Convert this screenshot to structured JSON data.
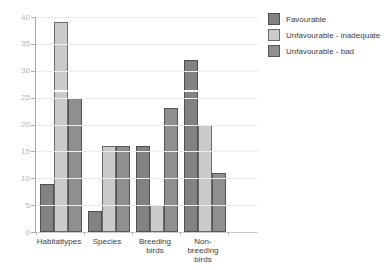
{
  "chart_data": {
    "type": "bar",
    "title": "",
    "xlabel": "",
    "ylabel": "",
    "ylim": [
      0,
      40
    ],
    "yticks": [
      0,
      5,
      10,
      15,
      20,
      25,
      30,
      35,
      40
    ],
    "grid": true,
    "legend_position": "top-right",
    "categories": [
      {
        "label": "Habitattypes",
        "lines": [
          "Habitattypes"
        ]
      },
      {
        "label": "Species",
        "lines": [
          "Species"
        ]
      },
      {
        "label": "Breeding birds",
        "lines": [
          "Breeding",
          "birds"
        ]
      },
      {
        "label": "Non-breeding birds",
        "lines": [
          "Non-breeding",
          "birds"
        ]
      }
    ],
    "series": [
      {
        "name": "Favourable",
        "color": "#828282",
        "border": "#4f4f4f",
        "values": [
          9,
          4,
          16,
          32
        ]
      },
      {
        "name": "Unfavourable - inadequate",
        "color": "#cbcbcb",
        "border": "#6a6a6a",
        "values": [
          39,
          16,
          5,
          20
        ]
      },
      {
        "name": "Unfavourable - bad",
        "color": "#8f8f8f",
        "border": "#555555",
        "values": [
          25,
          16,
          23,
          11
        ]
      }
    ]
  },
  "colors": {
    "background": "#ffffff",
    "gridline": "#ececec",
    "y_axis_line": "#a8a8a8",
    "x_axis_line": "#c9c9c9",
    "tick": "#b0b0b0",
    "y_label_text": "#b5b5b5",
    "category_label_text": "#3d3d3d",
    "legend_text": "#3d3d3d"
  }
}
